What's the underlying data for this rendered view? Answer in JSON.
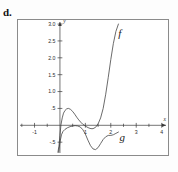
{
  "figure": {
    "item_label": "d."
  },
  "chart_data": {
    "type": "line",
    "title": "",
    "xlabel": "x",
    "ylabel": "y",
    "grid": false,
    "legend_position": "inline-annotation",
    "xlim": [
      -1.65,
      4.25
    ],
    "ylim": [
      -0.88,
      3.12
    ],
    "xticks": [
      -1,
      1,
      2,
      3,
      4
    ],
    "xticklabels": [
      "-1",
      "1",
      "2",
      "3",
      "4"
    ],
    "xminorticks": [
      -1.5,
      -0.5,
      0.5,
      1.5,
      2.5,
      3.5
    ],
    "yticks": [
      0.5,
      1.0,
      1.5,
      2.0,
      2.5,
      3.0
    ],
    "yticklabels": [
      ".5",
      "1.0",
      "1.5",
      "2.0",
      "2.5",
      "3.0"
    ],
    "ynegticks": [
      -0.5
    ],
    "ynegticklabels": [
      "-.5"
    ],
    "annotations": [
      {
        "text": "f",
        "x": 2.35,
        "y": 2.62
      },
      {
        "text": "g",
        "x": 2.45,
        "y": -0.47
      },
      {
        "text": "x",
        "x": 4.12,
        "y": 0.12
      },
      {
        "text": "y",
        "x": 0.18,
        "y": 3.02
      }
    ],
    "series": [
      {
        "name": "f",
        "label": "f",
        "points_x": [
          -0.08,
          -0.04,
          0.0,
          0.04,
          0.09,
          0.14,
          0.2,
          0.27,
          0.34,
          0.42,
          0.5,
          0.58,
          0.66,
          0.74,
          0.82,
          0.9,
          0.98,
          1.06,
          1.14,
          1.22,
          1.3,
          1.4,
          1.5,
          1.6,
          1.7,
          1.8,
          1.9,
          2.0,
          2.1,
          2.2,
          2.3
        ],
        "points_y": [
          -0.8,
          -0.62,
          -0.3,
          0.02,
          0.22,
          0.36,
          0.44,
          0.49,
          0.5,
          0.47,
          0.41,
          0.33,
          0.24,
          0.16,
          0.09,
          0.03,
          -0.01,
          -0.05,
          -0.08,
          -0.1,
          -0.1,
          -0.06,
          0.04,
          0.22,
          0.5,
          0.92,
          1.42,
          1.95,
          2.42,
          2.78,
          3.0
        ]
      },
      {
        "name": "g",
        "label": "g",
        "points_x": [
          -0.05,
          0.0,
          0.06,
          0.12,
          0.2,
          0.3,
          0.4,
          0.5,
          0.6,
          0.7,
          0.8,
          0.9,
          1.0,
          1.1,
          1.2,
          1.3,
          1.4,
          1.5,
          1.6,
          1.7,
          1.8,
          1.9,
          2.0,
          2.1,
          2.2,
          2.3
        ],
        "points_y": [
          -0.8,
          -0.5,
          -0.28,
          -0.18,
          -0.12,
          -0.07,
          -0.04,
          -0.02,
          -0.01,
          -0.02,
          -0.05,
          -0.13,
          -0.26,
          -0.44,
          -0.6,
          -0.7,
          -0.72,
          -0.66,
          -0.54,
          -0.42,
          -0.34,
          -0.3,
          -0.3,
          -0.28,
          -0.24,
          -0.2
        ]
      }
    ]
  }
}
